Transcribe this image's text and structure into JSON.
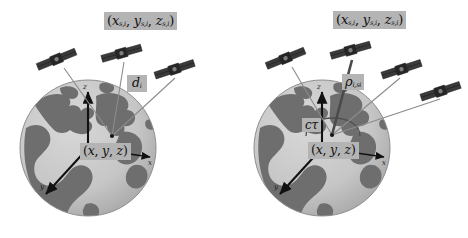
{
  "figure": {
    "background_color": "#ffffff",
    "width": 468,
    "height": 238,
    "panel_count": 2
  },
  "colors": {
    "ocean": "#c9c9c9",
    "land": "#6e6e6e",
    "globe_shadow": "#9a9a9a",
    "label_background": "#b4b4b4",
    "label_text": "#101010",
    "axis": "#111111",
    "ray_thin": "#8c8c8c",
    "ray_thick": "#4a4a4a",
    "satellite_body": "#2a2a2a",
    "satellite_panel": "#3d3d3d"
  },
  "panels": [
    {
      "id": "left",
      "name": "geometric-range-panel",
      "globe": {
        "name": "earth-globe",
        "center": [
          88,
          148
        ],
        "radius": 68
      },
      "axes": {
        "origin_label": "origin",
        "z": {
          "label": "z",
          "direction": "up"
        },
        "y": {
          "label": "y",
          "direction": "lower-left"
        },
        "x": {
          "label": "x",
          "direction": "right"
        }
      },
      "satellites": [
        {
          "name": "satellite-1",
          "x": 57,
          "y": 59
        },
        {
          "name": "satellite-2",
          "x": 122,
          "y": 53
        },
        {
          "name": "satellite-3",
          "x": 175,
          "y": 69
        }
      ],
      "rays": {
        "count": 3,
        "style": "thin",
        "converge_at": [
          112,
          136
        ]
      },
      "labels": {
        "satellite_position": {
          "name": "satellite-position-label",
          "parts": {
            "open": "(",
            "x": "x",
            "xsub": "s,i",
            "c1": ", ",
            "y": "y",
            "ysub": "s,i",
            "c2": ", ",
            "z": "z",
            "zsub": "s,i",
            "close": ")"
          },
          "text": "(xs,i, ys,i, zs,i)"
        },
        "range": {
          "name": "geometric-range-label",
          "symbol": "d",
          "subscript": "i",
          "text": "di"
        },
        "receiver_position": {
          "name": "receiver-position-label",
          "parts": {
            "open": "(",
            "x": "x",
            "c1": ", ",
            "y": "y",
            "c2": ", ",
            "z": "z",
            "close": ")"
          },
          "text": "(x, y, z)"
        }
      }
    },
    {
      "id": "right",
      "name": "pseudorange-panel",
      "globe": {
        "name": "earth-globe",
        "center": [
          88,
          148
        ],
        "radius": 68
      },
      "axes": {
        "origin_label": "origin",
        "z": {
          "label": "z",
          "direction": "up"
        },
        "y": {
          "label": "y",
          "direction": "lower-left"
        },
        "x": {
          "label": "x",
          "direction": "right"
        }
      },
      "satellites": [
        {
          "name": "satellite-1",
          "x": 52,
          "y": 58
        },
        {
          "name": "satellite-2",
          "x": 117,
          "y": 50
        },
        {
          "name": "satellite-3",
          "x": 168,
          "y": 69
        },
        {
          "name": "satellite-4",
          "x": 207,
          "y": 91
        }
      ],
      "rays": {
        "count": 4,
        "style": "mixed",
        "converge_at": [
          98,
          135
        ]
      },
      "clock_bias_arc": {
        "name": "clock-bias-arc",
        "description": "arc from receiver showing clock offset distance"
      },
      "labels": {
        "satellite_position": {
          "name": "satellite-position-label",
          "parts": {
            "open": "(",
            "x": "x",
            "xsub": "s,i",
            "c1": ", ",
            "y": "y",
            "ysub": "s,i",
            "c2": ", ",
            "z": "z",
            "zsub": "s,i",
            "close": ")"
          },
          "text": "(xs,i, ys,i, zs,i)"
        },
        "pseudorange": {
          "name": "pseudorange-label",
          "symbol": "ρ",
          "subscript": "i,si",
          "text": "ρi,si"
        },
        "clock_bias": {
          "name": "clock-bias-label",
          "symbol_c": "c",
          "symbol_tau": "τ",
          "text": "cτ"
        },
        "receiver_position": {
          "name": "receiver-position-label",
          "parts": {
            "open": "(",
            "x": "x",
            "c1": ", ",
            "y": "y",
            "c2": ", ",
            "z": "z",
            "close": ")"
          },
          "text": "(x, y, z)"
        }
      }
    }
  ]
}
